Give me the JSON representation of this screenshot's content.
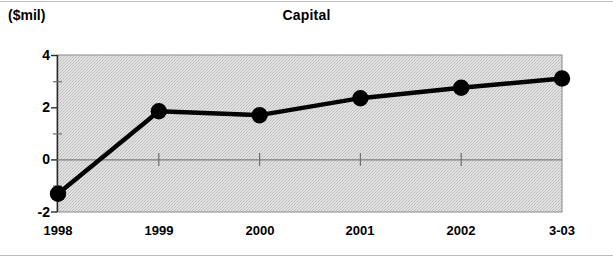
{
  "chart_data": {
    "type": "line",
    "title": "Capital",
    "ylabel": "($mil)",
    "xlabel": "",
    "categories": [
      "1998",
      "1999",
      "2000",
      "2001",
      "2002",
      "3-03"
    ],
    "values": [
      -1.3,
      1.85,
      1.7,
      2.35,
      2.75,
      3.1
    ],
    "series": [
      {
        "name": "Capital",
        "values": [
          -1.3,
          1.85,
          1.7,
          2.35,
          2.75,
          3.1
        ]
      }
    ],
    "ylim": [
      -2,
      4
    ],
    "ytick_labels": [
      "4",
      "2",
      "0",
      "-2"
    ],
    "ytick_values": [
      4,
      2,
      0,
      -2
    ],
    "yminor_tick_values": [
      3,
      1,
      -1
    ],
    "xtick_labels": [
      "1998",
      "1999",
      "2000",
      "2001",
      "2002",
      "3-03"
    ],
    "grid": false,
    "zero_line": true,
    "legend": "none",
    "plot_background": "#d9d9d9",
    "line_color": "#000000",
    "marker": "circle",
    "marker_color": "#000000"
  },
  "figure": {
    "title": "Capital",
    "units_label": "($mil)",
    "frame_color": "#808080"
  },
  "axes": {
    "y": {
      "ticks": [
        {
          "label": "4",
          "value": 4
        },
        {
          "label": "2",
          "value": 2
        },
        {
          "label": "0",
          "value": 0
        },
        {
          "label": "-2",
          "value": -2
        }
      ]
    },
    "x": {
      "ticks": [
        {
          "label": "1998"
        },
        {
          "label": "1999"
        },
        {
          "label": "2000"
        },
        {
          "label": "2001"
        },
        {
          "label": "2002"
        },
        {
          "label": "3-03"
        }
      ]
    }
  }
}
